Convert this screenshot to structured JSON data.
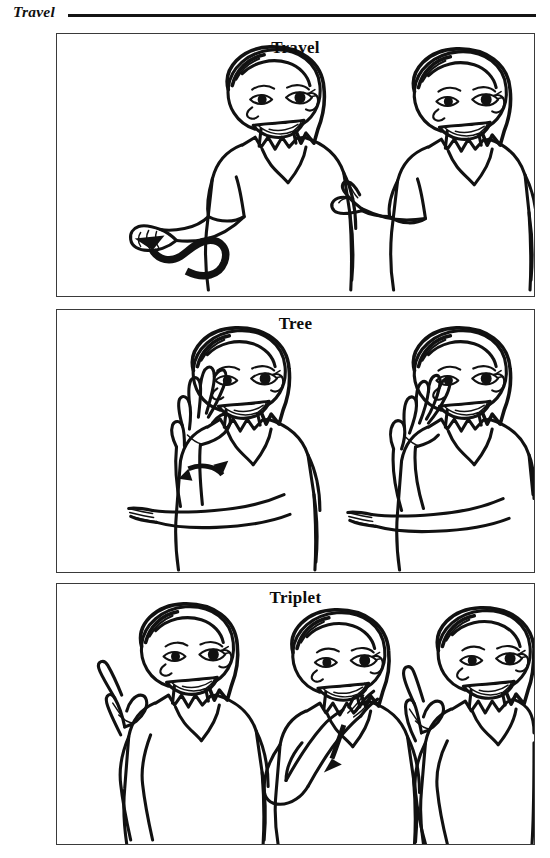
{
  "page": {
    "running_header": "Travel",
    "width": 550,
    "height": 858,
    "ink_color": "#111111",
    "border_color": "#3a3a3a",
    "background": "#ffffff"
  },
  "panels": [
    {
      "id": "travel",
      "title": "Travel",
      "figure_count": 2,
      "figures": [
        {
          "index": 1,
          "description": "Woman facing right, smiling, right arm extended forward with a bent-V handshape; a thick wavy arrow curves away to the left showing forward travel motion.",
          "handshape": "bent-V",
          "motion_arrow": "wavy-arrow-left"
        },
        {
          "index": 2,
          "description": "Woman facing right, smiling, hand raised in front of the body with a bent-V handshape at the end of the motion.",
          "handshape": "bent-V",
          "motion_arrow": "none"
        }
      ]
    },
    {
      "id": "tree",
      "title": "Tree",
      "figure_count": 2,
      "figures": [
        {
          "index": 1,
          "description": "Woman with right forearm upright, open 5-hand with fingers spread; left arm horizontal beneath supporting the elbow. A small double-headed twist arrow marks the wrist rotation.",
          "handshape": "open-5",
          "motion_arrow": "twist-arrow-double"
        },
        {
          "index": 2,
          "description": "Woman with right forearm upright, hand rotated so the spread fingers angle to the side; left arm horizontal beneath supporting the elbow.",
          "handshape": "open-5-rotated",
          "motion_arrow": "none"
        }
      ]
    },
    {
      "id": "triplet",
      "title": "Triplet",
      "figure_count": 3,
      "figures": [
        {
          "index": 1,
          "description": "Woman holding a 3-handshape up beside the chest.",
          "handshape": "3-hand",
          "motion_arrow": "none"
        },
        {
          "index": 2,
          "description": "Woman touching the 3-handshape to the forehead, arrow showing the hand moving down the cheek.",
          "handshape": "3-hand",
          "motion_arrow": "down-arrow"
        },
        {
          "index": 3,
          "description": "Woman ending with the 3-handshape beside the cheek.",
          "handshape": "3-hand",
          "motion_arrow": "none"
        }
      ]
    }
  ]
}
